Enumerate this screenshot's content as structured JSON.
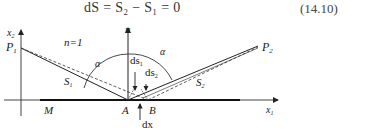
{
  "equation": {
    "text": "dS = S₂ − S₁ = 0",
    "number": "(14.10)"
  },
  "diagram": {
    "labels": {
      "x2_axis": "x",
      "x2_sub": "2",
      "x1_axis": "x",
      "x1_sub": "1",
      "n_axis": "n",
      "medium": "n=1",
      "p1": "P",
      "p1_sub": "1",
      "p2": "P",
      "p2_sub": "2",
      "s1": "S",
      "s1_sub": "1",
      "s2": "S",
      "s2_sub": "2",
      "alpha_left": "α",
      "alpha_right": "α",
      "ds1": "ds",
      "ds1_sub": "1",
      "ds2": "ds",
      "ds2_sub": "2",
      "point_a": "A",
      "point_b": "B",
      "point_m": "M",
      "dx": "dx"
    },
    "colors": {
      "line": "#222222",
      "axis": "#444444"
    }
  }
}
